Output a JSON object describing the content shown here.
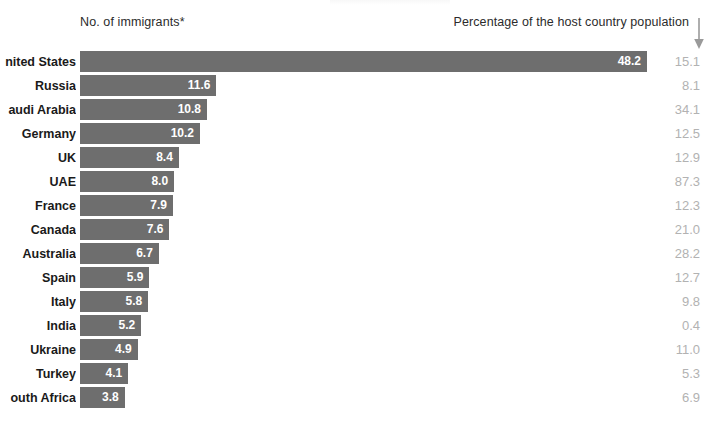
{
  "header": {
    "left_label": "No. of immigrants*",
    "right_label": "Percentage of the host country population",
    "arrow_icon": "arrow-down-icon"
  },
  "style": {
    "bar_color": "#6e6e6e",
    "bar_value_color": "#ffffff",
    "percent_color": "#b2b2b2",
    "label_color": "#1a1a1a",
    "background": "#ffffff"
  },
  "chart_data": {
    "type": "bar",
    "orientation": "horizontal",
    "title": "",
    "xlabel": "No. of immigrants*",
    "ylabel": "",
    "grid": false,
    "legend": "none",
    "xlim": [
      0,
      48.2
    ],
    "categories": [
      "nited States",
      "Russia",
      "audi Arabia",
      "Germany",
      "UK",
      "UAE",
      "France",
      "Canada",
      "Australia",
      "Spain",
      "Italy",
      "India",
      "Ukraine",
      "Turkey",
      "outh Africa"
    ],
    "series": [
      {
        "name": "No. of immigrants*",
        "values": [
          48.2,
          11.6,
          10.8,
          10.2,
          8.4,
          8.0,
          7.9,
          7.6,
          6.7,
          5.9,
          5.8,
          5.2,
          4.9,
          4.1,
          3.8
        ]
      },
      {
        "name": "Percentage of the host country population",
        "values": [
          15.1,
          8.1,
          34.1,
          12.5,
          12.9,
          87.3,
          12.3,
          21.0,
          28.2,
          12.7,
          9.8,
          0.4,
          11.0,
          5.3,
          6.9
        ]
      }
    ]
  },
  "rows": [
    {
      "label": "nited States",
      "value": "48.2",
      "num": 48.2,
      "pct": "15.1"
    },
    {
      "label": "Russia",
      "value": "11.6",
      "num": 11.6,
      "pct": "8.1"
    },
    {
      "label": "audi Arabia",
      "value": "10.8",
      "num": 10.8,
      "pct": "34.1"
    },
    {
      "label": "Germany",
      "value": "10.2",
      "num": 10.2,
      "pct": "12.5"
    },
    {
      "label": "UK",
      "value": "8.4",
      "num": 8.4,
      "pct": "12.9"
    },
    {
      "label": "UAE",
      "value": "8.0",
      "num": 8.0,
      "pct": "87.3"
    },
    {
      "label": "France",
      "value": "7.9",
      "num": 7.9,
      "pct": "12.3"
    },
    {
      "label": "Canada",
      "value": "7.6",
      "num": 7.6,
      "pct": "21.0"
    },
    {
      "label": "Australia",
      "value": "6.7",
      "num": 6.7,
      "pct": "28.2"
    },
    {
      "label": "Spain",
      "value": "5.9",
      "num": 5.9,
      "pct": "12.7"
    },
    {
      "label": "Italy",
      "value": "5.8",
      "num": 5.8,
      "pct": "9.8"
    },
    {
      "label": "India",
      "value": "5.2",
      "num": 5.2,
      "pct": "0.4"
    },
    {
      "label": "Ukraine",
      "value": "4.9",
      "num": 4.9,
      "pct": "11.0"
    },
    {
      "label": "Turkey",
      "value": "4.1",
      "num": 4.1,
      "pct": "5.3"
    },
    {
      "label": "outh Africa",
      "value": "3.8",
      "num": 3.8,
      "pct": "6.9"
    }
  ]
}
